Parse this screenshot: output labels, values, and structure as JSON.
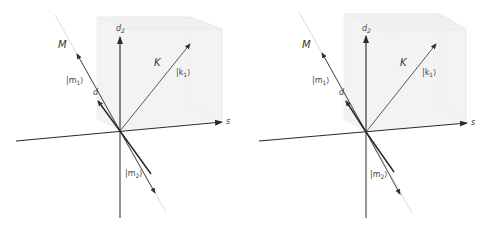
{
  "figure": {
    "panels": [
      {
        "id": "left",
        "labels": {
          "axis_vertical": "d",
          "axis_vertical_sub": "2",
          "axis_horizontal": "s",
          "subspace_M": "M",
          "subspace_K": "K",
          "ket_m1": "|m",
          "ket_m1_sub": "1",
          "ket_m1_close": "⟩",
          "ket_k1": "|k",
          "ket_k1_sub": "1",
          "ket_k1_close": "⟩",
          "ket_m2": "|m",
          "ket_m2_sub": "2",
          "ket_m2_close": "⟩",
          "vector_d": "d"
        }
      },
      {
        "id": "right",
        "labels": {
          "axis_vertical": "d",
          "axis_vertical_sub": "2",
          "axis_horizontal": "s",
          "subspace_M": "M",
          "subspace_K": "K",
          "ket_m1": "|m",
          "ket_m1_sub": "1",
          "ket_m1_close": "⟩",
          "ket_k1": "|k",
          "ket_k1_sub": "1",
          "ket_k1_close": "⟩",
          "ket_m2": "|m",
          "ket_m2_sub": "2",
          "ket_m2_close": "⟩",
          "vector_d": "d"
        }
      }
    ],
    "colors": {
      "axis": "#2a2a2a",
      "vector": "#333333",
      "box_fill": "#f2f2f2",
      "box_edge": "#e2e2e2",
      "line_M_fade": "#d8d8d8"
    }
  }
}
